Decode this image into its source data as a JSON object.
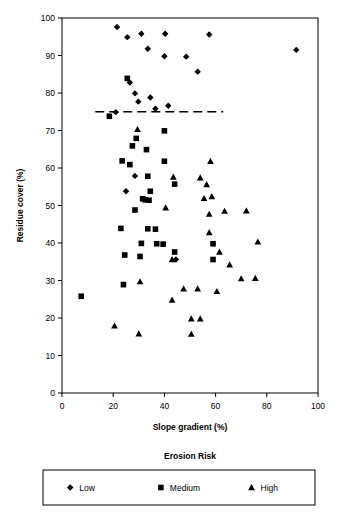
{
  "chart_data": {
    "type": "scatter",
    "title": "",
    "xlabel": "Slope gradient (%)",
    "ylabel": "Residue cover (%)",
    "xlim": [
      0,
      100
    ],
    "ylim": [
      0,
      100
    ],
    "xticks": [
      0,
      20,
      40,
      60,
      80,
      100
    ],
    "yticks": [
      0,
      10,
      20,
      30,
      40,
      50,
      60,
      70,
      80,
      90,
      100
    ],
    "xtick_labels": [
      "0",
      "20",
      "40",
      "60",
      "80",
      "100"
    ],
    "ytick_labels": [
      "0",
      "10",
      "20",
      "30",
      "40",
      "50",
      "60",
      "70",
      "80",
      "90",
      "100"
    ],
    "grid": false,
    "legend_title": "Erosion Risk",
    "legend_position": "bottom",
    "annotations": [
      {
        "kind": "reference-line",
        "orientation": "horizontal",
        "y": 75,
        "x_start": 13,
        "x_end": 63,
        "style": "dashed",
        "label": ""
      }
    ],
    "series": [
      {
        "name": "Low",
        "marker": "diamond",
        "color": "#000000",
        "points": [
          [
            21.5,
            97.6
          ],
          [
            25.5,
            94.9
          ],
          [
            31.0,
            95.8
          ],
          [
            33.5,
            91.8
          ],
          [
            40.3,
            95.8
          ],
          [
            40.0,
            89.8
          ],
          [
            48.5,
            89.7
          ],
          [
            57.5,
            95.6
          ],
          [
            53.0,
            85.7
          ],
          [
            91.5,
            91.5
          ],
          [
            26.5,
            82.8
          ],
          [
            28.5,
            79.9
          ],
          [
            29.8,
            77.7
          ],
          [
            34.5,
            78.8
          ],
          [
            36.5,
            75.8
          ],
          [
            41.5,
            76.6
          ],
          [
            21.0,
            74.9
          ],
          [
            25.0,
            53.8
          ],
          [
            28.5,
            57.9
          ],
          [
            44.5,
            35.6
          ]
        ]
      },
      {
        "name": "Medium",
        "marker": "square",
        "color": "#000000",
        "points": [
          [
            25.5,
            83.9
          ],
          [
            18.5,
            73.8
          ],
          [
            29.0,
            67.9
          ],
          [
            27.5,
            65.9
          ],
          [
            33.0,
            64.9
          ],
          [
            23.5,
            61.9
          ],
          [
            26.5,
            60.9
          ],
          [
            40.0,
            61.8
          ],
          [
            33.5,
            57.8
          ],
          [
            44.0,
            55.7
          ],
          [
            34.5,
            53.8
          ],
          [
            31.5,
            51.8
          ],
          [
            32.5,
            51.5
          ],
          [
            34.0,
            51.4
          ],
          [
            40.0,
            69.9
          ],
          [
            28.5,
            48.8
          ],
          [
            23.0,
            43.9
          ],
          [
            33.5,
            43.8
          ],
          [
            36.5,
            43.7
          ],
          [
            31.0,
            39.9
          ],
          [
            37.0,
            39.8
          ],
          [
            39.5,
            39.7
          ],
          [
            59.0,
            39.8
          ],
          [
            30.5,
            36.4
          ],
          [
            24.5,
            36.8
          ],
          [
            44.0,
            37.6
          ],
          [
            59.0,
            35.6
          ],
          [
            24.0,
            28.9
          ],
          [
            7.5,
            25.8
          ]
        ]
      },
      {
        "name": "High",
        "marker": "triangle",
        "color": "#000000",
        "points": [
          [
            29.5,
            70.3
          ],
          [
            58.0,
            61.8
          ],
          [
            43.5,
            57.6
          ],
          [
            54.0,
            57.4
          ],
          [
            56.5,
            55.6
          ],
          [
            58.5,
            52.4
          ],
          [
            55.5,
            51.9
          ],
          [
            40.5,
            49.4
          ],
          [
            57.5,
            47.7
          ],
          [
            63.5,
            48.5
          ],
          [
            72.0,
            48.6
          ],
          [
            57.5,
            42.8
          ],
          [
            61.5,
            37.6
          ],
          [
            76.5,
            40.3
          ],
          [
            43.0,
            35.6
          ],
          [
            65.5,
            34.2
          ],
          [
            30.5,
            29.7
          ],
          [
            70.0,
            30.5
          ],
          [
            75.5,
            30.6
          ],
          [
            47.5,
            27.8
          ],
          [
            53.0,
            27.8
          ],
          [
            60.5,
            27.1
          ],
          [
            43.0,
            24.8
          ],
          [
            50.5,
            19.8
          ],
          [
            54.0,
            19.8
          ],
          [
            20.5,
            17.9
          ],
          [
            30.0,
            15.8
          ],
          [
            50.5,
            15.7
          ]
        ]
      }
    ]
  },
  "legend": {
    "title": "Erosion Risk",
    "entries": [
      {
        "label": "Low",
        "marker": "diamond"
      },
      {
        "label": "Medium",
        "marker": "square"
      },
      {
        "label": "High",
        "marker": "triangle"
      }
    ]
  },
  "axes": {
    "x_title": "Slope gradient (%)",
    "y_title": "Residue cover (%)"
  }
}
